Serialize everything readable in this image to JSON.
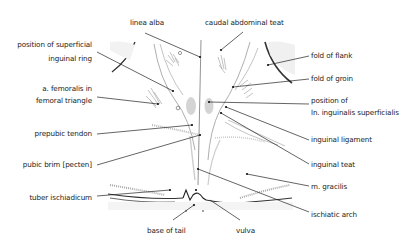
{
  "diagram": {
    "labels_left": [
      {
        "id": "superficial-inguinal-ring",
        "lines": [
          "position of superficial",
          "inguinal ring"
        ]
      },
      {
        "id": "a-femoralis",
        "lines": [
          "a. femoralis in",
          "femoral triangle"
        ]
      },
      {
        "id": "prepubic-tendon",
        "lines": [
          "prepubic tendon"
        ]
      },
      {
        "id": "pubic-brim",
        "lines": [
          "pubic brim [pecten]"
        ]
      },
      {
        "id": "tuber-ischiadicum",
        "lines": [
          "tuber ischiadicum"
        ]
      }
    ],
    "labels_top": [
      {
        "id": "linea-alba",
        "lines": [
          "linea alba"
        ]
      },
      {
        "id": "caudal-abdominal-teat",
        "lines": [
          "caudal abdominal teat"
        ]
      }
    ],
    "labels_right": [
      {
        "id": "fold-of-flank",
        "lines": [
          "fold of flank"
        ]
      },
      {
        "id": "fold-of-groin",
        "lines": [
          "fold of groin"
        ]
      },
      {
        "id": "ln-inguinalis",
        "lines": [
          "position of",
          "ln. inguinalis superficialis"
        ]
      },
      {
        "id": "inguinal-ligament",
        "lines": [
          "inguinal ligament"
        ]
      },
      {
        "id": "inguinal-teat",
        "lines": [
          "inguinal teat"
        ]
      },
      {
        "id": "m-gracilis",
        "lines": [
          "m. gracilis"
        ]
      },
      {
        "id": "ischiatic-arch",
        "lines": [
          "ischiatic arch"
        ]
      }
    ],
    "labels_bottom": [
      {
        "id": "base-of-tail",
        "lines": [
          "base of tail"
        ]
      },
      {
        "id": "vulva",
        "lines": [
          "vulva"
        ]
      }
    ],
    "colors": {
      "line": "#222222",
      "sketch": "#9a9a9a",
      "shade": "#d8d8d8"
    }
  }
}
